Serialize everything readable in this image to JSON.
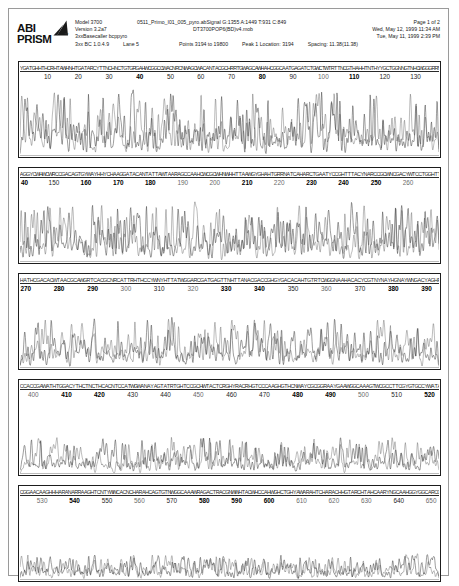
{
  "document": {
    "title": "ABI PRISM Sequencing Electropherogram",
    "sheet_border_color": "#9a9a9a"
  },
  "logo": {
    "line1": "ABI",
    "line2": "PRISM",
    "trademark": "™",
    "mark_name": "abi-prism-triangle"
  },
  "header": {
    "left_column": {
      "model": "Model 3700",
      "version": "Version 3.2a7",
      "basecaller": "3xxBasecaller bcppyro",
      "bc_version": "3xx BC 1.0.4.9",
      "lane": "Lane 5"
    },
    "middle_column": {
      "sample_name": "0511_Primo_I01_005_pyro.ab",
      "signal": "Signal G:1355 A:1449 T:931 C:849",
      "mobility_file": "DT3700POP6(BD)v4.mob",
      "points": "Points 3194 to 19800",
      "peak1": "Peak 1 Location: 3194",
      "spacing": "Spacing: 11.38(11.38)"
    },
    "right_column": {
      "page": "Page 1 of 2",
      "print_date": "Wed, May 12, 1999  11:34 AM",
      "run_date": "Tue, May 11, 1999  2:39 PM"
    }
  },
  "chart_data": {
    "type": "line",
    "xlabel": "Base position",
    "ylabel": "Fluorescence intensity",
    "grid": false,
    "legend": null,
    "panel_count": 5,
    "base_position_range": [
      1,
      655
    ],
    "panels": [
      {
        "index": 1,
        "name": "trace-panel-1",
        "range": [
          1,
          138
        ],
        "ticks": [
          {
            "label": "10",
            "pos": 0.068,
            "weight": "normal"
          },
          {
            "label": "20",
            "pos": 0.141,
            "weight": "normal"
          },
          {
            "label": "30",
            "pos": 0.214,
            "weight": "normal"
          },
          {
            "label": "40",
            "pos": 0.287,
            "weight": "bold"
          },
          {
            "label": "50",
            "pos": 0.36,
            "weight": "normal"
          },
          {
            "label": "60",
            "pos": 0.432,
            "weight": "normal"
          },
          {
            "label": "70",
            "pos": 0.505,
            "weight": "normal"
          },
          {
            "label": "80",
            "pos": 0.578,
            "weight": "bold"
          },
          {
            "label": "90",
            "pos": 0.651,
            "weight": "normal"
          },
          {
            "label": "100",
            "pos": 0.723,
            "weight": "light"
          },
          {
            "label": "110",
            "pos": 0.796,
            "weight": "bold"
          },
          {
            "label": "120",
            "pos": 0.869,
            "weight": "normal"
          },
          {
            "label": "130",
            "pos": 0.942,
            "weight": "normal"
          }
        ],
        "amplitude": 0.92,
        "baseline_noise": 0.08,
        "seed": 1101
      },
      {
        "index": 2,
        "name": "trace-panel-2",
        "range": [
          139,
          269
        ],
        "ticks": [
          {
            "label": "40",
            "pos": 0.006,
            "weight": "bold",
            "clipped": true
          },
          {
            "label": "150",
            "pos": 0.083,
            "weight": "normal"
          },
          {
            "label": "160",
            "pos": 0.159,
            "weight": "bold"
          },
          {
            "label": "170",
            "pos": 0.236,
            "weight": "bold"
          },
          {
            "label": "180",
            "pos": 0.312,
            "weight": "bold"
          },
          {
            "label": "190",
            "pos": 0.389,
            "weight": "light"
          },
          {
            "label": "200",
            "pos": 0.465,
            "weight": "light"
          },
          {
            "label": "210",
            "pos": 0.542,
            "weight": "bold"
          },
          {
            "label": "220",
            "pos": 0.618,
            "weight": "light"
          },
          {
            "label": "230",
            "pos": 0.695,
            "weight": "bold"
          },
          {
            "label": "240",
            "pos": 0.771,
            "weight": "bold"
          },
          {
            "label": "250",
            "pos": 0.848,
            "weight": "bold"
          },
          {
            "label": "260",
            "pos": 0.924,
            "weight": "light"
          }
        ],
        "amplitude": 0.84,
        "baseline_noise": 0.1,
        "seed": 2203
      },
      {
        "index": 3,
        "name": "trace-panel-3",
        "range": [
          270,
          395
        ],
        "ticks": [
          {
            "label": "270",
            "pos": 0.016,
            "weight": "bold"
          },
          {
            "label": "280",
            "pos": 0.095,
            "weight": "bold"
          },
          {
            "label": "290",
            "pos": 0.175,
            "weight": "bold"
          },
          {
            "label": "300",
            "pos": 0.254,
            "weight": "light"
          },
          {
            "label": "310",
            "pos": 0.333,
            "weight": "normal"
          },
          {
            "label": "320",
            "pos": 0.413,
            "weight": "light"
          },
          {
            "label": "330",
            "pos": 0.492,
            "weight": "bold"
          },
          {
            "label": "340",
            "pos": 0.571,
            "weight": "bold"
          },
          {
            "label": "350",
            "pos": 0.651,
            "weight": "normal"
          },
          {
            "label": "360",
            "pos": 0.73,
            "weight": "light"
          },
          {
            "label": "370",
            "pos": 0.81,
            "weight": "normal"
          },
          {
            "label": "380",
            "pos": 0.889,
            "weight": "bold"
          },
          {
            "label": "390",
            "pos": 0.968,
            "weight": "bold"
          }
        ],
        "amplitude": 0.7,
        "baseline_noise": 0.12,
        "seed": 3307
      },
      {
        "index": 4,
        "name": "trace-panel-4",
        "range": [
          396,
          524
        ],
        "ticks": [
          {
            "label": "400",
            "pos": 0.034,
            "weight": "light"
          },
          {
            "label": "410",
            "pos": 0.113,
            "weight": "bold"
          },
          {
            "label": "420",
            "pos": 0.191,
            "weight": "bold"
          },
          {
            "label": "430",
            "pos": 0.27,
            "weight": "normal"
          },
          {
            "label": "440",
            "pos": 0.348,
            "weight": "normal"
          },
          {
            "label": "450",
            "pos": 0.426,
            "weight": "light"
          },
          {
            "label": "460",
            "pos": 0.505,
            "weight": "normal"
          },
          {
            "label": "470",
            "pos": 0.583,
            "weight": "normal"
          },
          {
            "label": "480",
            "pos": 0.662,
            "weight": "bold"
          },
          {
            "label": "490",
            "pos": 0.74,
            "weight": "bold"
          },
          {
            "label": "500",
            "pos": 0.818,
            "weight": "light"
          },
          {
            "label": "510",
            "pos": 0.897,
            "weight": "normal"
          },
          {
            "label": "520",
            "pos": 0.975,
            "weight": "bold"
          }
        ],
        "amplitude": 0.52,
        "baseline_noise": 0.16,
        "seed": 4409
      },
      {
        "index": 5,
        "name": "trace-panel-5",
        "range": [
          525,
          655
        ],
        "ticks": [
          {
            "label": "530",
            "pos": 0.055,
            "weight": "light"
          },
          {
            "label": "540",
            "pos": 0.132,
            "weight": "bold"
          },
          {
            "label": "550",
            "pos": 0.209,
            "weight": "normal"
          },
          {
            "label": "560",
            "pos": 0.286,
            "weight": "light"
          },
          {
            "label": "570",
            "pos": 0.363,
            "weight": "normal"
          },
          {
            "label": "580",
            "pos": 0.44,
            "weight": "bold"
          },
          {
            "label": "590",
            "pos": 0.517,
            "weight": "bold"
          },
          {
            "label": "600",
            "pos": 0.594,
            "weight": "bold"
          },
          {
            "label": "610",
            "pos": 0.671,
            "weight": "light"
          },
          {
            "label": "620",
            "pos": 0.748,
            "weight": "light"
          },
          {
            "label": "630",
            "pos": 0.825,
            "weight": "light"
          },
          {
            "label": "640",
            "pos": 0.902,
            "weight": "normal"
          },
          {
            "label": "650",
            "pos": 0.979,
            "weight": "light"
          }
        ],
        "amplitude": 0.36,
        "baseline_noise": 0.2,
        "seed": 5511
      }
    ],
    "trace_color": "#3a3a3a",
    "basecall_letters": "GATCGNACTGCAWHRY"
  }
}
